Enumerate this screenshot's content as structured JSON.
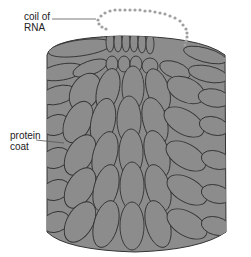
{
  "diagram": {
    "labels": [
      {
        "id": "rna",
        "text_line1": "coil of",
        "text_line2": "RNA"
      },
      {
        "id": "coat",
        "text_line1": "protein",
        "text_line2": "coat"
      }
    ],
    "colors": {
      "subunit_fill": "#8c8c8c",
      "subunit_stroke": "#333333",
      "rna_dots": "#a0a0a0",
      "leader_line": "#555555"
    }
  }
}
